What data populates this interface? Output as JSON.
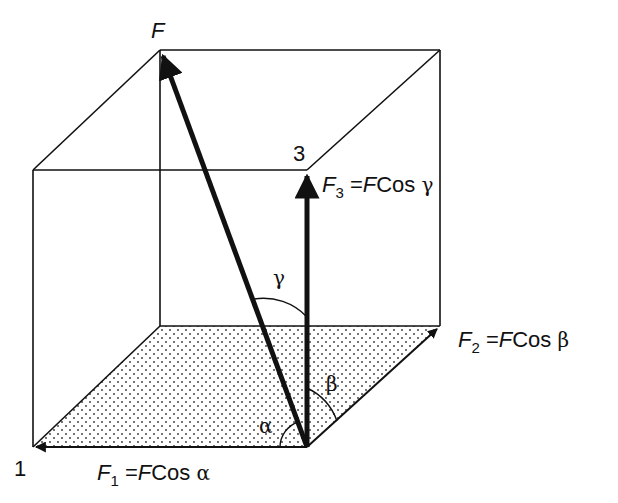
{
  "diagram": {
    "labels": {
      "force": "F",
      "axis1": "1",
      "axis3": "3",
      "angle_alpha": "α",
      "angle_beta": "β",
      "angle_gamma": "γ"
    },
    "equations": {
      "f1": {
        "sym": "F",
        "sub": "1",
        "rhs_italic": "F",
        "rhs_text": "Cos",
        "angle": "α"
      },
      "f2": {
        "sym": "F",
        "sub": "2",
        "rhs_italic": "F",
        "rhs_text": "Cos",
        "angle": "β"
      },
      "f3": {
        "sym": "F",
        "sub": "3",
        "rhs_italic": "F",
        "rhs_text": "Cos",
        "angle": "γ"
      }
    },
    "equals": "=",
    "colors": {
      "ink": "#111111",
      "background": "#ffffff",
      "stipple": "#333333"
    }
  }
}
